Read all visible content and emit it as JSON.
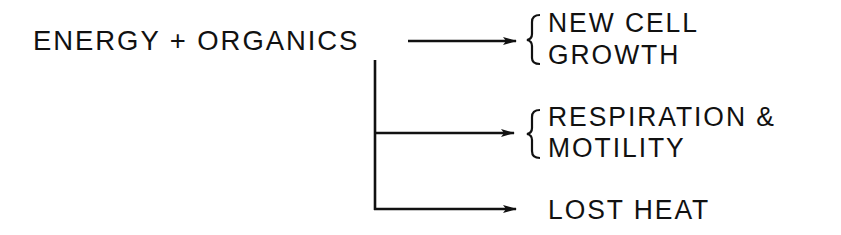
{
  "diagram": {
    "source": {
      "label": "ENERGY + ORGANICS"
    },
    "outputs": [
      {
        "lines": [
          "NEW CELL",
          "GROWTH"
        ],
        "bracketed": true
      },
      {
        "lines": [
          "RESPIRATION &",
          "MOTILITY"
        ],
        "bracketed": true
      },
      {
        "lines": [
          "LOST HEAT"
        ],
        "bracketed": false
      }
    ],
    "colors": {
      "ink": "#111111",
      "background": "#ffffff"
    }
  }
}
